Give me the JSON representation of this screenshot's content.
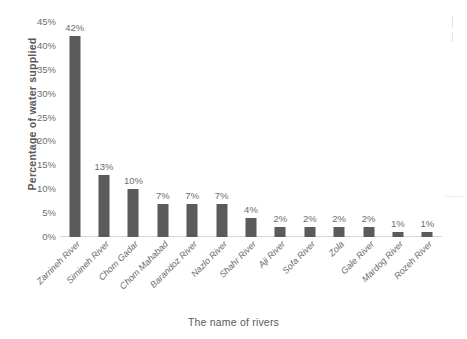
{
  "chart_data": {
    "type": "bar",
    "title": "",
    "subtitle": "",
    "xlabel": "The name of rivers",
    "ylabel": "Percentage of water supplied",
    "categories": [
      "Zarrineh River",
      "Simineh River",
      "Chom Gadar",
      "Chom Mahabad",
      "Barandoz River",
      "Nazlo River",
      "Shahr River",
      "Aji River",
      "Sofa River",
      "Zola",
      "Gale River",
      "Mardog River",
      "Rozeh River"
    ],
    "values": [
      42,
      13,
      10,
      7,
      7,
      7,
      4,
      2,
      2,
      2,
      2,
      1,
      1
    ],
    "data_labels": [
      "42%",
      "13%",
      "10%",
      "7%",
      "7%",
      "7%",
      "4%",
      "2%",
      "2%",
      "2%",
      "2%",
      "1%",
      "1%"
    ],
    "ylim": [
      0,
      45
    ],
    "ytick_values": [
      0,
      5,
      10,
      15,
      20,
      25,
      30,
      35,
      40,
      45
    ],
    "ytick_labels": [
      "0%",
      "5%",
      "10%",
      "15%",
      "20%",
      "25%",
      "30%",
      "35%",
      "40%",
      "45%"
    ],
    "grid": false,
    "legend": false,
    "legend_position": "none",
    "series": [
      {
        "name": "Percentage of water supplied",
        "values": [
          42,
          13,
          10,
          7,
          7,
          7,
          4,
          2,
          2,
          2,
          2,
          1,
          1
        ]
      }
    ],
    "colors": {
      "bar": "#5b5b5b",
      "axis_line": "#d9d9d9",
      "tick_text": "#6e6e6e",
      "title_text": "#5a5a5a",
      "background": "#ffffff"
    }
  },
  "axes": {
    "y_title": "Percentage of water supplied",
    "x_title": "The name of rivers"
  }
}
